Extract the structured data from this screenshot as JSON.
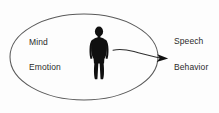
{
  "diagram": {
    "type": "concept-diagram",
    "background_color": "#fdfdfd",
    "stroke_color": "#4a4a4a",
    "figure_color": "#101010",
    "text_color": "#2b2b2b",
    "container": {
      "shape": "ellipse",
      "center_x": 84,
      "center_y": 57,
      "radius_x": 74,
      "radius_y": 43,
      "fill": "none",
      "stroke_width": 1
    },
    "inside_labels": [
      {
        "id": "mind",
        "text": "Mind",
        "x": 29,
        "y": 37
      },
      {
        "id": "emotion",
        "text": "Emotion",
        "x": 29,
        "y": 62
      }
    ],
    "outside_labels": [
      {
        "id": "speech",
        "text": "Speech",
        "x": 174,
        "y": 36
      },
      {
        "id": "behavior",
        "text": "Behavior",
        "x": 174,
        "y": 62
      }
    ],
    "figure": {
      "id": "human-silhouette",
      "description": "black standing human figure",
      "center_x": 99,
      "top_y": 27,
      "bottom_y": 79
    },
    "arrow": {
      "id": "outward-arrow",
      "description": "curved arrow from inside ellipse pointing right past the boundary",
      "start_x": 113,
      "start_y": 51,
      "end_x": 168,
      "end_y": 58,
      "direction": "right",
      "head_style": "solid-triangle"
    }
  }
}
